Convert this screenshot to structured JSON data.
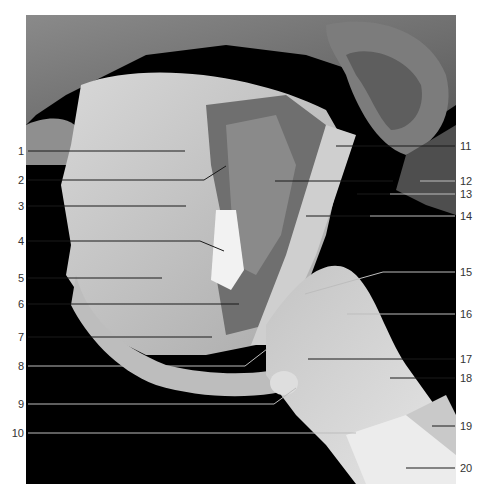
{
  "figure": {
    "colors": {
      "background": "#ffffff",
      "photo_background": "#000000",
      "label_text": "#333333",
      "leader_dark": "#1a1a1a",
      "leader_light": "#bdbdbd"
    },
    "labels_left": [
      {
        "num": "1",
        "y": 151
      },
      {
        "num": "2",
        "y": 180
      },
      {
        "num": "3",
        "y": 206
      },
      {
        "num": "4",
        "y": 241
      },
      {
        "num": "5",
        "y": 278
      },
      {
        "num": "6",
        "y": 304
      },
      {
        "num": "7",
        "y": 337
      },
      {
        "num": "8",
        "y": 366
      },
      {
        "num": "9",
        "y": 404
      },
      {
        "num": "10",
        "y": 433
      }
    ],
    "labels_right": [
      {
        "num": "11",
        "y": 146
      },
      {
        "num": "12",
        "y": 181
      },
      {
        "num": "13",
        "y": 194
      },
      {
        "num": "14",
        "y": 216
      },
      {
        "num": "15",
        "y": 272
      },
      {
        "num": "16",
        "y": 314
      },
      {
        "num": "17",
        "y": 359
      },
      {
        "num": "18",
        "y": 378
      },
      {
        "num": "19",
        "y": 426
      },
      {
        "num": "20",
        "y": 468
      }
    ]
  }
}
